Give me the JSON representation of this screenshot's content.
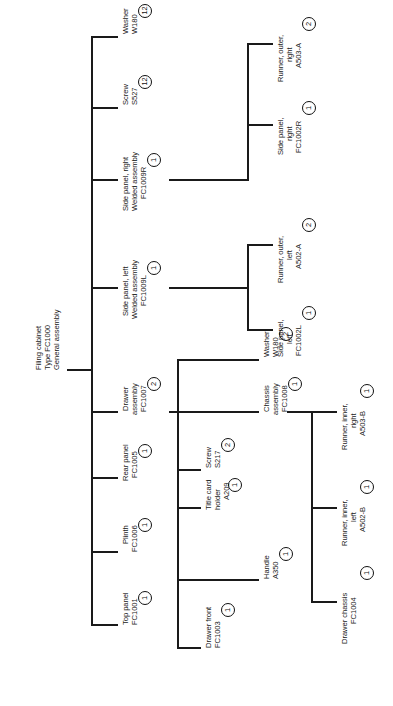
{
  "diagram": {
    "type": "bill-of-materials-tree",
    "orientation": "rotated-90-counterclockwise",
    "title_node": "Filing cabinet Type FC1000 General assembly",
    "line_color": "#1a1a1a",
    "text_color": "#1a1a1a",
    "background": "#ffffff"
  },
  "nodes": {
    "root": {
      "line1": "Filing cabinet",
      "line2": "Type FC1000",
      "line3": "General assembly",
      "qty": ""
    },
    "washer_top": {
      "line1": "Washer",
      "line2": "W180",
      "line3": "",
      "qty": "12"
    },
    "screw_top": {
      "line1": "Screw",
      "line2": "S527",
      "line3": "",
      "qty": "12"
    },
    "side_panel_right_welded": {
      "line1": "Side panel, right",
      "line2": "Welded assembly",
      "line3": "FC1009R",
      "qty": "1"
    },
    "side_panel_left_welded": {
      "line1": "Side panel, left",
      "line2": "Welded assembly",
      "line3": "FC1009L",
      "qty": "1"
    },
    "drawer_assembly": {
      "line1": "Drawer",
      "line2": "assembly",
      "line3": "FC1007",
      "qty": "2"
    },
    "rear_panel": {
      "line1": "Rear panel",
      "line2": "FC1005",
      "line3": "",
      "qty": "1"
    },
    "plinth": {
      "line1": "Plinth",
      "line2": "FC1006",
      "line3": "",
      "qty": "1"
    },
    "top_panel": {
      "line1": "Top panel",
      "line2": "FC1001",
      "line3": "",
      "qty": "1"
    },
    "runner_outer_right": {
      "line1": "Runner, outer,",
      "line2": "right",
      "line3": "A503-A",
      "qty": "2"
    },
    "side_panel_right": {
      "line1": "Side panel,",
      "line2": "right",
      "line3": "FC1002R",
      "qty": "1"
    },
    "runner_outer_left": {
      "line1": "Runner, outer,",
      "line2": "left",
      "line3": "A502-A",
      "qty": "2"
    },
    "side_panel_left": {
      "line1": "Side panel,",
      "line2": "left",
      "line3": "FC1002L",
      "qty": "1"
    },
    "washer_drawer": {
      "line1": "Washer",
      "line2": "W180",
      "line3": "",
      "qty": "2"
    },
    "chassis_assembly": {
      "line1": "Chassis",
      "line2": "assembly",
      "line3": "FC1008",
      "qty": "1"
    },
    "screw_drawer": {
      "line1": "Screw",
      "line2": "S217",
      "line3": "",
      "qty": "2"
    },
    "title_card_holder": {
      "line1": "Title card",
      "line2": "holder",
      "line3": "A209",
      "qty": "1"
    },
    "handle": {
      "line1": "Handle",
      "line2": "A350",
      "line3": "",
      "qty": "1"
    },
    "drawer_front": {
      "line1": "Drawer front",
      "line2": "FC1003",
      "line3": "",
      "qty": "1"
    },
    "runner_inner_right": {
      "line1": "Runner, inner,",
      "line2": "right",
      "line3": "A503-B",
      "qty": "1"
    },
    "runner_inner_left": {
      "line1": "Runner, inner,",
      "line2": "left",
      "line3": "A502-B",
      "qty": "1"
    },
    "drawer_chassis": {
      "line1": "Drawer chassis",
      "line2": "FC1004",
      "line3": "",
      "qty": "1"
    }
  }
}
